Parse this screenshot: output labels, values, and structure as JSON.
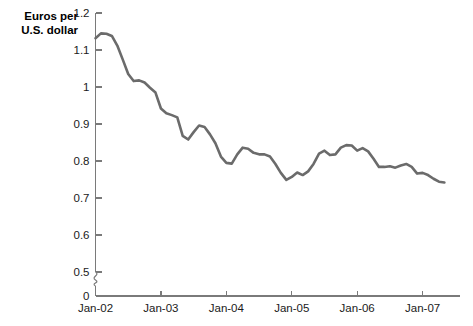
{
  "chart_data": {
    "type": "line",
    "title": "",
    "ylabel": "Euros per\nU.S. dollar",
    "xlabel": "",
    "ylim": [
      0.5,
      1.2
    ],
    "y_break_to_zero": true,
    "grid": false,
    "legend": false,
    "line_color": "#6b6b6b",
    "axis_color": "#7a7a7a",
    "y_ticks": [
      "0",
      "0.5",
      "0.6",
      "0.7",
      "0.8",
      "0.9",
      "1",
      "1.1",
      "1.2"
    ],
    "y_tick_values": [
      0,
      0.5,
      0.6,
      0.7,
      0.8,
      0.9,
      1.0,
      1.1,
      1.2
    ],
    "x_ticks": [
      "Jan-02",
      "Jan-03",
      "Jan-04",
      "Jan-05",
      "Jan-06",
      "Jan-07"
    ],
    "x_tick_values": [
      2002.0,
      2003.0,
      2004.0,
      2005.0,
      2006.0,
      2007.0
    ],
    "xlim": [
      2002.0,
      2007.35
    ],
    "series": [
      {
        "name": "Euros per U.S. dollar",
        "x": [
          2002.0,
          2002.083,
          2002.167,
          2002.25,
          2002.333,
          2002.417,
          2002.5,
          2002.583,
          2002.667,
          2002.75,
          2002.833,
          2002.917,
          2003.0,
          2003.083,
          2003.167,
          2003.25,
          2003.333,
          2003.417,
          2003.5,
          2003.583,
          2003.667,
          2003.75,
          2003.833,
          2003.917,
          2004.0,
          2004.083,
          2004.167,
          2004.25,
          2004.333,
          2004.417,
          2004.5,
          2004.583,
          2004.667,
          2004.75,
          2004.833,
          2004.917,
          2005.0,
          2005.083,
          2005.167,
          2005.25,
          2005.333,
          2005.417,
          2005.5,
          2005.583,
          2005.667,
          2005.75,
          2005.833,
          2005.917,
          2006.0,
          2006.083,
          2006.167,
          2006.25,
          2006.333,
          2006.417,
          2006.5,
          2006.583,
          2006.667,
          2006.75,
          2006.833,
          2006.917,
          2007.0,
          2007.083,
          2007.167,
          2007.25,
          2007.333
        ],
        "y": [
          1.132,
          1.145,
          1.144,
          1.138,
          1.112,
          1.074,
          1.035,
          1.016,
          1.018,
          1.012,
          0.998,
          0.985,
          0.942,
          0.929,
          0.924,
          0.918,
          0.868,
          0.858,
          0.878,
          0.896,
          0.892,
          0.872,
          0.848,
          0.812,
          0.795,
          0.793,
          0.818,
          0.836,
          0.833,
          0.822,
          0.818,
          0.818,
          0.812,
          0.792,
          0.768,
          0.749,
          0.757,
          0.769,
          0.762,
          0.772,
          0.792,
          0.82,
          0.828,
          0.816,
          0.818,
          0.836,
          0.843,
          0.842,
          0.828,
          0.835,
          0.826,
          0.806,
          0.784,
          0.784,
          0.786,
          0.782,
          0.788,
          0.792,
          0.784,
          0.766,
          0.768,
          0.762,
          0.752,
          0.744,
          0.742
        ]
      }
    ]
  },
  "axis_title": "Euros per\nU.S. dollar"
}
